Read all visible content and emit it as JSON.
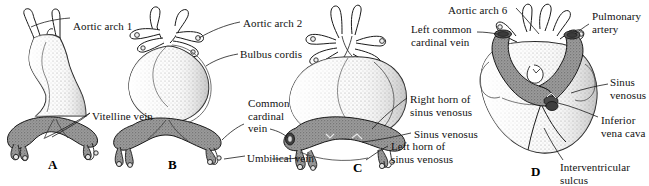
{
  "figure": {
    "background_color": "#ffffff",
    "ink_color": "#1a1a1a",
    "venous_fill_color": "#8a8a8a",
    "myocardium_fill_color": "#f2f2f2",
    "stipple_color": "#6e6e6e"
  },
  "panels": [
    {
      "id": "A",
      "letter": "A",
      "x": 48,
      "y": 157
    },
    {
      "id": "B",
      "letter": "B",
      "x": 168,
      "y": 157
    },
    {
      "id": "C",
      "letter": "C",
      "x": 353,
      "y": 160
    },
    {
      "id": "D",
      "letter": "D",
      "x": 531,
      "y": 164
    }
  ],
  "labels": [
    {
      "name": "aortic-arch-1",
      "text": "Aortic arch 1",
      "x": 73,
      "y": 20,
      "align": "left"
    },
    {
      "name": "vitelline-vein",
      "text": "Vitelline vein",
      "x": 92,
      "y": 110,
      "align": "left"
    },
    {
      "name": "aortic-arch-2",
      "text": "Aortic arch 2",
      "x": 243,
      "y": 17,
      "align": "left"
    },
    {
      "name": "bulbus-cordis",
      "text": "Bulbus cordis",
      "x": 240,
      "y": 48,
      "align": "left"
    },
    {
      "name": "common-cardinal-vein",
      "text": "Common\ncardinal\nvein",
      "x": 248,
      "y": 97,
      "align": "left"
    },
    {
      "name": "umbilical-vein",
      "text": "Umbilical vein",
      "x": 247,
      "y": 152,
      "align": "left"
    },
    {
      "name": "aortic-arch-6",
      "text": "Aortic arch 6",
      "x": 448,
      "y": 4,
      "align": "left"
    },
    {
      "name": "left-common-cardinal-vein",
      "text": "Left common\ncardinal vein",
      "x": 411,
      "y": 23,
      "align": "left"
    },
    {
      "name": "pulmonary-artery",
      "text": "Pulmonary\nartery",
      "x": 592,
      "y": 10,
      "align": "left"
    },
    {
      "name": "right-horn-of-sinus-venosus",
      "text": "Right horn of\nsinus venosus",
      "x": 410,
      "y": 93,
      "align": "left"
    },
    {
      "name": "sinus-venosus-c",
      "text": "Sinus venosus",
      "x": 414,
      "y": 128,
      "align": "left"
    },
    {
      "name": "left-horn-of-sinus-venosus",
      "text": "Left horn of\nsinus venosus",
      "x": 391,
      "y": 140,
      "align": "left"
    },
    {
      "name": "sinus-venosus-d",
      "text": "Sinus\nvenosus",
      "x": 610,
      "y": 76,
      "align": "left"
    },
    {
      "name": "inferior-vena-cava",
      "text": "Inferior\nvena cava",
      "x": 601,
      "y": 114,
      "align": "left"
    },
    {
      "name": "interventricular-sulcus",
      "text": "Interventricular\nsulcus",
      "x": 560,
      "y": 161,
      "align": "left"
    }
  ]
}
